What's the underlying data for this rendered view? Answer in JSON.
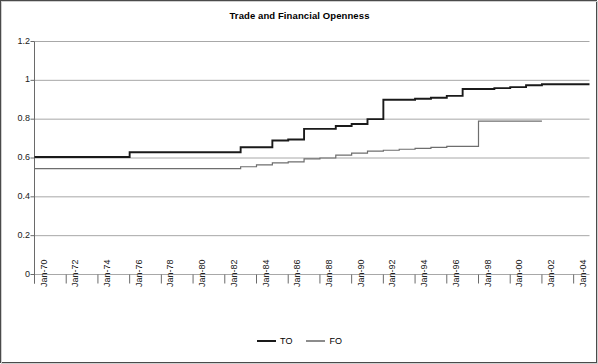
{
  "chart_data": {
    "type": "line",
    "title": "Trade and Financial Openness",
    "xlabel": "",
    "ylabel": "",
    "ylim": [
      0,
      1.2
    ],
    "yticks": [
      "0",
      "0.2",
      "0.4",
      "0.6",
      "0.8",
      "1",
      "1.2"
    ],
    "ytick_values": [
      0,
      0.2,
      0.4,
      0.6,
      0.8,
      1,
      1.2
    ],
    "grid": true,
    "legend_position": "bottom",
    "xtick_labels": [
      "Jan-70",
      "Jan-72",
      "Jan-74",
      "Jan-76",
      "Jan-78",
      "Jan-80",
      "Jan-82",
      "Jan-84",
      "Jan-86",
      "Jan-88",
      "Jan-90",
      "Jan-92",
      "Jan-94",
      "Jan-96",
      "Jan-98",
      "Jan-00",
      "Jan-02",
      "Jan-04"
    ],
    "xtick_years": [
      1970,
      1972,
      1974,
      1976,
      1978,
      1980,
      1982,
      1984,
      1986,
      1988,
      1990,
      1992,
      1994,
      1996,
      1998,
      2000,
      2002,
      2004
    ],
    "xlim": [
      1970,
      2005
    ],
    "series": [
      {
        "name": "TO",
        "color": "#1a1a1a",
        "width": 1.9,
        "x": [
          1970,
          1971,
          1972,
          1973,
          1974,
          1975,
          1976,
          1977,
          1978,
          1979,
          1980,
          1981,
          1982,
          1983,
          1984,
          1985,
          1986,
          1987,
          1988,
          1989,
          1990,
          1991,
          1992,
          1993,
          1994,
          1995,
          1996,
          1997,
          1998,
          1999,
          2000,
          2001,
          2002,
          2003,
          2004,
          2005
        ],
        "values": [
          0.605,
          0.605,
          0.605,
          0.605,
          0.605,
          0.605,
          0.63,
          0.63,
          0.63,
          0.63,
          0.63,
          0.63,
          0.63,
          0.655,
          0.655,
          0.69,
          0.695,
          0.75,
          0.75,
          0.765,
          0.775,
          0.8,
          0.9,
          0.9,
          0.905,
          0.91,
          0.92,
          0.955,
          0.955,
          0.96,
          0.965,
          0.975,
          0.98,
          0.98,
          0.98,
          0.98
        ]
      },
      {
        "name": "FO",
        "color": "#6e6e6e",
        "width": 1.2,
        "x": [
          1970,
          1971,
          1972,
          1973,
          1974,
          1975,
          1976,
          1977,
          1978,
          1979,
          1980,
          1981,
          1982,
          1983,
          1984,
          1985,
          1986,
          1987,
          1988,
          1989,
          1990,
          1991,
          1992,
          1993,
          1994,
          1995,
          1996,
          1997,
          1998,
          1999,
          2000,
          2001,
          2002
        ],
        "values": [
          0.545,
          0.545,
          0.545,
          0.545,
          0.545,
          0.545,
          0.545,
          0.545,
          0.545,
          0.545,
          0.545,
          0.545,
          0.545,
          0.555,
          0.565,
          0.575,
          0.58,
          0.595,
          0.6,
          0.615,
          0.625,
          0.635,
          0.64,
          0.645,
          0.65,
          0.655,
          0.66,
          0.66,
          0.79,
          0.79,
          0.79,
          0.79,
          0.79
        ]
      }
    ]
  },
  "legend": {
    "entries": [
      {
        "label": "TO"
      },
      {
        "label": "FO"
      }
    ]
  },
  "colors": {
    "to_line": "#1a1a1a",
    "fo_line": "#6e6e6e",
    "grid": "#a8a8a8",
    "axis": "#6a6a6a",
    "frame": "#4a4a4a"
  }
}
